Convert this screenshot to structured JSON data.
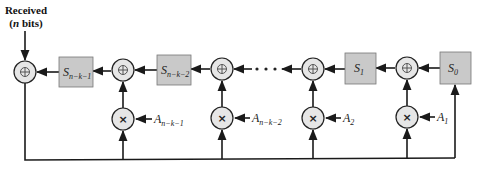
{
  "diagram": {
    "input_label": {
      "line1": "Received",
      "line2_prefix": "(",
      "line2_var": "n",
      "line2_suffix": " bits)"
    },
    "registers": [
      {
        "id": "s_n_k_1",
        "main": "S",
        "sub": "n−k−1"
      },
      {
        "id": "s_n_k_2",
        "main": "S",
        "sub": "n−k−2"
      },
      {
        "id": "s_1",
        "main": "S",
        "sub": "1"
      },
      {
        "id": "s_0",
        "main": "S",
        "sub": "0"
      }
    ],
    "coefficients": [
      {
        "id": "a_n_k_1",
        "main": "A",
        "sub": "n−k−1"
      },
      {
        "id": "a_n_k_2",
        "main": "A",
        "sub": "n−k−2"
      },
      {
        "id": "a_2",
        "main": "A",
        "sub": "2"
      },
      {
        "id": "a_1",
        "main": "A",
        "sub": "1"
      }
    ],
    "xor_symbol": "⊕",
    "multiply_symbol": "×",
    "ellipsis": "• • •",
    "colors": {
      "register_fill": "#c9c9c9",
      "operator_fill": "#e6e6e6",
      "line": "#1a1a1a"
    }
  }
}
